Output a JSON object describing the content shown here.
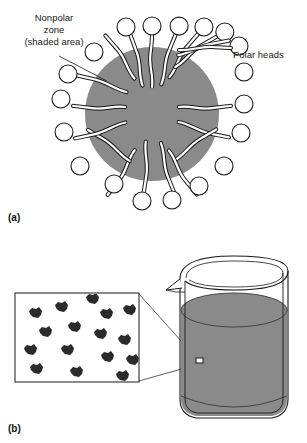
{
  "figure": {
    "colors": {
      "shaded_zone_gray": "#8a8a8a",
      "liquid_gray": "#8a8a8a",
      "outline_black": "#1a1a1a",
      "head_fill_white": "#ffffff",
      "micelle_cluster_dark": "#2b2b2b",
      "background_white": "#ffffff"
    },
    "panels": [
      {
        "id": "panel-a",
        "letter": "(a)",
        "subject": "micelle-cross-section",
        "labels": [
          {
            "name": "nonpolar-zone-label",
            "lines": [
              "Nonpolar",
              "zone",
              "(shaded area)"
            ],
            "align": "center",
            "has_leader_line": true
          },
          {
            "name": "polar-heads-label",
            "lines": [
              "Polar heads"
            ],
            "align": "left",
            "has_leader_line": false
          }
        ],
        "shaded_zone": {
          "center_x": 152,
          "center_y": 114,
          "radius": 67
        },
        "core": {
          "center_x": 152,
          "center_y": 114,
          "radius": 27
        },
        "surfactant_count": 18,
        "head_radius": 9
      },
      {
        "id": "panel-b",
        "letter": "(b)",
        "subject": "beaker-with-micelle-solution",
        "inset": {
          "name": "magnified-region-inset",
          "cluster_count": 16,
          "x": 15,
          "y": 293,
          "width": 125,
          "height": 89
        },
        "beaker": {
          "has_pour_spout": true,
          "liquid_fill": "gray",
          "liquid_level_y": 310
        },
        "callout": {
          "marker_x": 196,
          "marker_y": 361,
          "marker_width": 7,
          "marker_height": 5
        }
      }
    ]
  }
}
